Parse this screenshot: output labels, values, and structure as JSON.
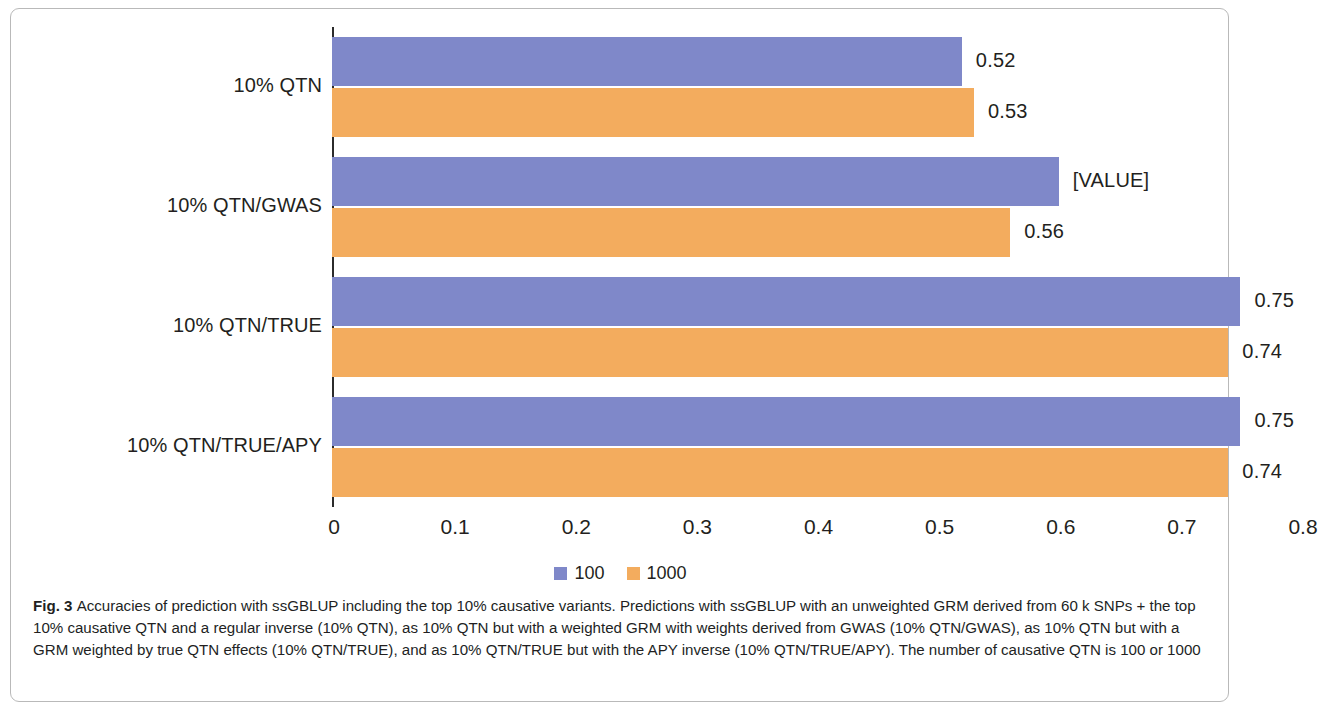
{
  "figure": {
    "label": "Fig. 3",
    "caption": "Accuracies of prediction with ssGBLUP including the top 10% causative variants. Predictions with ssGBLUP with an unweighted GRM derived from 60 k SNPs + the top 10% causative QTN and a regular inverse (10% QTN), as 10% QTN but with a weighted GRM with weights derived from GWAS (10% QTN/GWAS), as 10% QTN but with a GRM weighted by true QTN effects (10% QTN/TRUE), and as 10% QTN/TRUE but with the APY inverse (10% QTN/TRUE/APY). The number of causative QTN is 100 or 1000"
  },
  "colors": {
    "series_100": "#7f88c9",
    "series_1000": "#f3ac5e",
    "axis": "#2b2b2b",
    "text": "#231f20",
    "frame": "#b9b9b9"
  },
  "chart_data": {
    "type": "bar",
    "orientation": "horizontal",
    "title": "",
    "xlabel": "",
    "ylabel": "",
    "grid": false,
    "legend_position": "bottom",
    "xlim": [
      0,
      0.8
    ],
    "xticks": [
      "0",
      "0.1",
      "0.2",
      "0.3",
      "0.4",
      "0.5",
      "0.6",
      "0.7",
      "0.8"
    ],
    "xtick_values": [
      0,
      0.1,
      0.2,
      0.3,
      0.4,
      0.5,
      0.6,
      0.7,
      0.8
    ],
    "categories": [
      "10% QTN",
      "10% QTN/GWAS",
      "10% QTN/TRUE",
      "10% QTN/TRUE/APY"
    ],
    "series": [
      {
        "name": "100",
        "color": "#7f88c9",
        "values": [
          0.52,
          0.6,
          0.75,
          0.75
        ],
        "labels": [
          "0.52",
          "[VALUE]",
          "0.75",
          "0.75"
        ]
      },
      {
        "name": "1000",
        "color": "#f3ac5e",
        "values": [
          0.53,
          0.56,
          0.74,
          0.74
        ],
        "labels": [
          "0.53",
          "0.56",
          "0.74",
          "0.74"
        ]
      }
    ]
  }
}
